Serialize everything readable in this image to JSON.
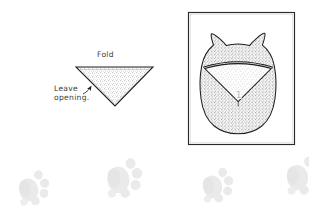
{
  "figure": {
    "type": "craft-instruction-diagram",
    "background_color": "#ffffff",
    "ink_color": "#222222",
    "stipple_color": "#8a8a8a",
    "pawprint_color": "#e8e8e8"
  },
  "labels": {
    "fold": "Fold",
    "leave_opening_line1": "Leave",
    "leave_opening_line2": "opening.",
    "step_number": "1"
  },
  "left_diagram": {
    "name": "fabric-triangle",
    "description": "Downward pointing stippled triangle representing folded fabric",
    "fold_edge": "top",
    "opening_edge": "left",
    "vertices": [
      {
        "x": 76,
        "y": 67
      },
      {
        "x": 153,
        "y": 67
      },
      {
        "x": 115,
        "y": 106
      }
    ],
    "arrow": {
      "from": {
        "x": 88,
        "y": 92
      },
      "to": {
        "x": 97,
        "y": 82
      }
    }
  },
  "right_diagram": {
    "name": "finished-toy-panel",
    "description": "Framed illustration of the completed cat shaped stuffed toy with folded triangular face flap",
    "frame": {
      "x": 188,
      "y": 12,
      "width": 107,
      "height": 133
    },
    "toy": {
      "shape": "rounded body with two pointed ears",
      "ears": 2,
      "face_flap": "triangle folded down from upper edge"
    }
  },
  "decorations": {
    "pawprints": [
      {
        "x": 18,
        "y": 170,
        "scale": 1.0,
        "rotate": -8
      },
      {
        "x": 104,
        "y": 158,
        "scale": 1.15,
        "rotate": -4
      },
      {
        "x": 200,
        "y": 166,
        "scale": 1.0,
        "rotate": -6
      },
      {
        "x": 284,
        "y": 156,
        "scale": 1.1,
        "rotate": -5
      }
    ]
  }
}
